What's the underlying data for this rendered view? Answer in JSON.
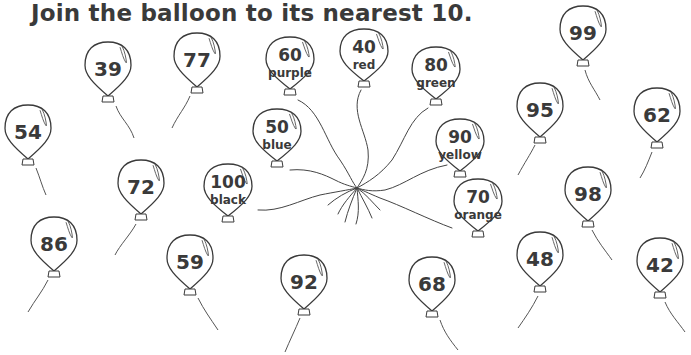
{
  "worksheet": {
    "title": "Join the balloon to its nearest 10."
  },
  "target_balloons": [
    {
      "value": "60",
      "label": "purple",
      "x": 290,
      "y": 68
    },
    {
      "value": "40",
      "label": "red",
      "x": 364,
      "y": 60
    },
    {
      "value": "80",
      "label": "green",
      "x": 436,
      "y": 78
    },
    {
      "value": "50",
      "label": "blue",
      "x": 277,
      "y": 140
    },
    {
      "value": "90",
      "label": "yellow",
      "x": 460,
      "y": 150
    },
    {
      "value": "100",
      "label": "black",
      "x": 228,
      "y": 195
    },
    {
      "value": "70",
      "label": "orange",
      "x": 478,
      "y": 210
    }
  ],
  "number_balloons": [
    {
      "value": "39",
      "x": 108,
      "y": 72
    },
    {
      "value": "77",
      "x": 197,
      "y": 63
    },
    {
      "value": "99",
      "x": 583,
      "y": 36
    },
    {
      "value": "54",
      "x": 28,
      "y": 135
    },
    {
      "value": "95",
      "x": 540,
      "y": 113
    },
    {
      "value": "62",
      "x": 657,
      "y": 118
    },
    {
      "value": "72",
      "x": 141,
      "y": 190
    },
    {
      "value": "98",
      "x": 588,
      "y": 197
    },
    {
      "value": "86",
      "x": 54,
      "y": 247
    },
    {
      "value": "59",
      "x": 190,
      "y": 265
    },
    {
      "value": "92",
      "x": 304,
      "y": 285
    },
    {
      "value": "68",
      "x": 432,
      "y": 287
    },
    {
      "value": "48",
      "x": 540,
      "y": 262
    },
    {
      "value": "42",
      "x": 660,
      "y": 268
    }
  ]
}
